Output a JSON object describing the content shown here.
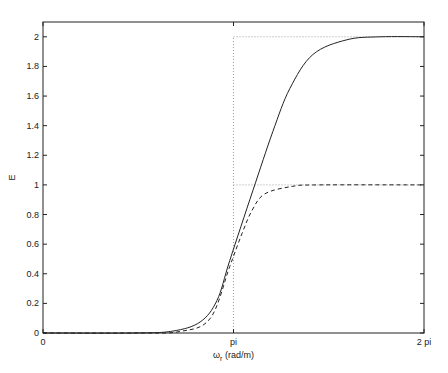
{
  "chart_data": {
    "type": "line",
    "title": "",
    "xlabel": "ω_r (rad/m)",
    "ylabel": "E",
    "xlim": [
      0,
      6.2832
    ],
    "ylim": [
      0,
      2.1
    ],
    "grid": false,
    "legend": null,
    "x_ticks": [
      {
        "value": 0,
        "label": "0"
      },
      {
        "value": 3.1416,
        "label": "pi"
      },
      {
        "value": 6.2832,
        "label": "2 pi"
      }
    ],
    "y_ticks": [
      {
        "value": 0,
        "label": "0"
      },
      {
        "value": 0.2,
        "label": "0.2"
      },
      {
        "value": 0.4,
        "label": "0.4"
      },
      {
        "value": 0.6,
        "label": "0.6"
      },
      {
        "value": 0.8,
        "label": "0.8"
      },
      {
        "value": 1.0,
        "label": "1"
      },
      {
        "value": 1.2,
        "label": "1.2"
      },
      {
        "value": 1.4,
        "label": "1.4"
      },
      {
        "value": 1.6,
        "label": "1.6"
      },
      {
        "value": 1.8,
        "label": "1.8"
      },
      {
        "value": 2.0,
        "label": "2"
      }
    ],
    "reference_lines": [
      {
        "type": "vertical",
        "x": 3.1416,
        "style": "dotted",
        "y_range": [
          0,
          2
        ]
      },
      {
        "type": "horizontal",
        "y": 2.0,
        "style": "dotted",
        "x_range": [
          3.1416,
          6.2832
        ]
      },
      {
        "type": "horizontal",
        "y": 1.0,
        "style": "dotted",
        "x_range": [
          3.1416,
          6.2832
        ]
      }
    ],
    "series": [
      {
        "name": "solid",
        "style": "solid",
        "x": [
          0,
          1.5,
          2.14,
          2.59,
          2.87,
          3.08,
          3.46,
          3.79,
          4.07,
          4.45,
          5.01,
          5.56,
          6.2832
        ],
        "y": [
          0,
          0,
          0.013,
          0.074,
          0.22,
          0.49,
          0.96,
          1.36,
          1.65,
          1.88,
          1.98,
          2.0,
          2.0
        ]
      },
      {
        "name": "dashed",
        "style": "dashed",
        "x": [
          0,
          1.5,
          2.26,
          2.76,
          3.08,
          3.28,
          3.45,
          3.66,
          4.11,
          4.54,
          6.2832
        ],
        "y": [
          0,
          0,
          0.01,
          0.1,
          0.45,
          0.67,
          0.83,
          0.94,
          0.99,
          1.0,
          1.0
        ]
      }
    ]
  }
}
